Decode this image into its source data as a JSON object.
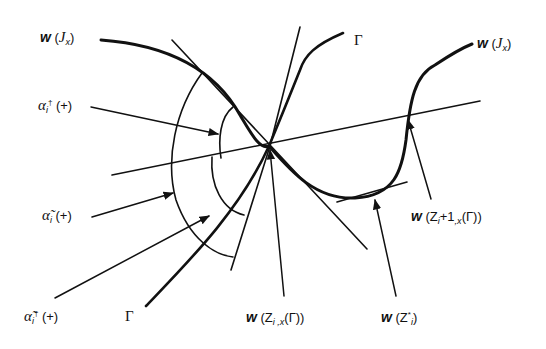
{
  "figure": {
    "type": "geometric diagram"
  },
  "labels": {
    "w_Jx_left": {
      "w": "w",
      "open": " (",
      "base": "J",
      "sub": "x",
      "close": ")"
    },
    "w_Jx_right": {
      "w": "w",
      "open": " (",
      "base": "J",
      "sub": "x",
      "close": ")"
    },
    "gamma_top": "Γ",
    "gamma_bottom": "Γ",
    "alpha_dagger": {
      "sym": "α",
      "sub": "i",
      "sup": "†",
      "sign": " (+)"
    },
    "alpha_tilde": {
      "sym": "α̃",
      "sub": "i",
      "sign": " (+)"
    },
    "alpha_tilde_dagger": {
      "sym": "α̃",
      "sub": "i",
      "sup": "†",
      "sign": " (+)"
    },
    "w_Z_i_x": {
      "w": "w",
      "text": " (Z",
      "sub": "i ,x",
      "tail": "(Γ))"
    },
    "w_Z_star": {
      "w": "w",
      "text": " (Z",
      "sup": "*",
      "sub": "i",
      "tail": ")"
    },
    "w_Z_i1_x": {
      "w": "w",
      "text": " (Z",
      "sub": "i",
      "mid": "+1",
      "sub2": ",x",
      "tail": "(Γ))"
    }
  },
  "colors": {
    "ink": "#111111",
    "background": "#ffffff"
  }
}
